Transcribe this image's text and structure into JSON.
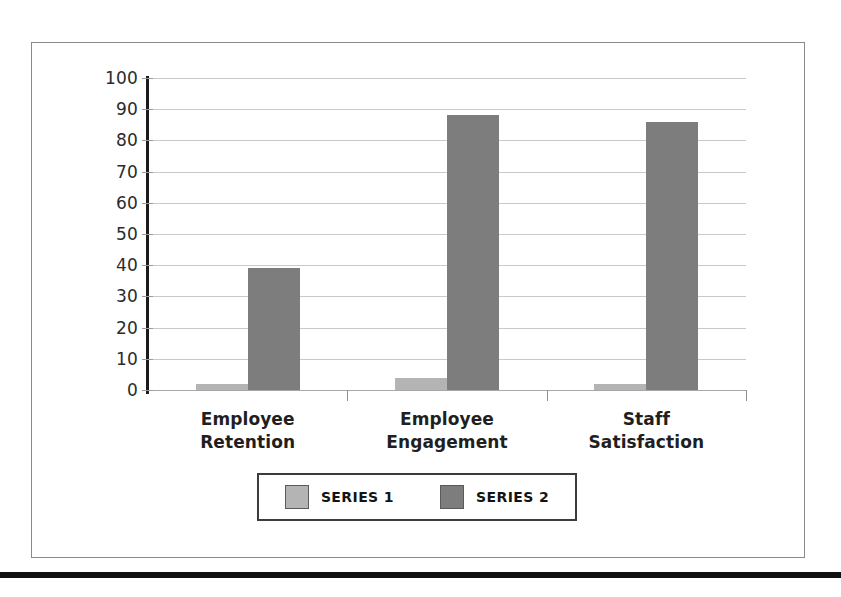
{
  "chart_data": {
    "type": "bar",
    "title": "",
    "xlabel": "",
    "ylabel": "",
    "ylim": [
      0,
      100
    ],
    "ytick_step": 10,
    "yticks": [
      "100",
      "90",
      "80",
      "70",
      "60",
      "50",
      "40",
      "30",
      "20",
      "10",
      "0"
    ],
    "grid": true,
    "legend_position": "bottom",
    "categories": [
      "Employee Retention",
      "Employee Engagement",
      "Staff Satisfaction"
    ],
    "series": [
      {
        "name": "SERIES 1",
        "color": "#b4b4b4",
        "values": [
          2,
          4,
          2
        ]
      },
      {
        "name": "SERIES 2",
        "color": "#7d7d7d",
        "values": [
          39,
          88,
          86
        ]
      }
    ]
  },
  "axis": {
    "y_labels": [
      "100",
      "90",
      "80",
      "70",
      "60",
      "50",
      "40",
      "30",
      "20",
      "10",
      "0"
    ]
  },
  "categories": [
    {
      "line1": "Employee",
      "line2": "Retention"
    },
    {
      "line1": "Employee",
      "line2": "Engagement"
    },
    {
      "line1": "Staff",
      "line2": "Satisfaction"
    }
  ],
  "legend": {
    "items": [
      {
        "label": "SERIES 1",
        "color": "#b4b4b4"
      },
      {
        "label": "SERIES 2",
        "color": "#7d7d7d"
      }
    ]
  },
  "colors": {
    "series1": "#b4b4b4",
    "series2": "#7d7d7d",
    "gridline": "#c9c9c9",
    "axis": "#1b1b1b",
    "frame": "#8a8a8a",
    "rule": "#111111"
  }
}
